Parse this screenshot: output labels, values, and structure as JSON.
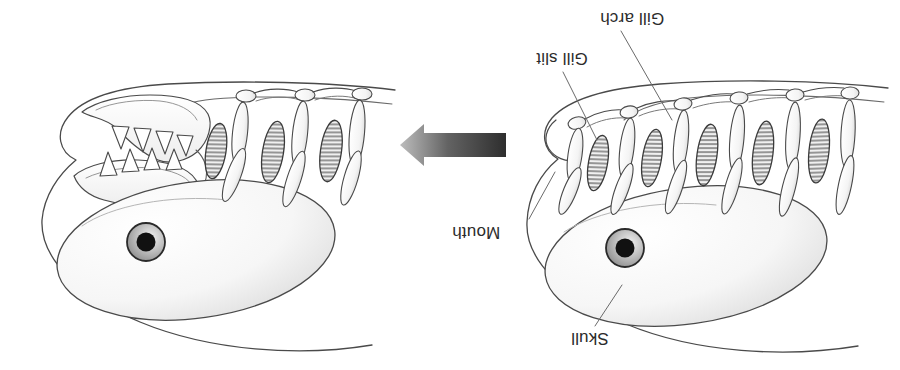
{
  "diagram": {
    "orientation": "rotated-180",
    "background_color": "#ffffff",
    "ink_color": "#3a3a3a",
    "label_color": "#2b2b2b"
  },
  "labels": {
    "gill_arch": "Gill arch",
    "gill_slit": "Gill slit",
    "mouth": "Mouth",
    "skull": "Skull"
  },
  "arrow": {
    "name": "transition-arrow",
    "direction": "left",
    "gradient_from": "#2e2e2e",
    "gradient_to": "#b9b9b9",
    "x": 400,
    "y": 132,
    "width": 106,
    "height": 27
  },
  "figures": [
    {
      "id": "jawed-fish",
      "name": "jawed-fish-head",
      "side": "left",
      "gill_arch_count": 3,
      "gill_slit_count": 3,
      "has_jaws": true,
      "tooth_count": 8,
      "eye": {
        "cx": 146,
        "cy": 242,
        "r_outer": 19,
        "r_pupil": 9
      }
    },
    {
      "id": "jawless-fish",
      "name": "jawless-fish-head",
      "side": "right",
      "gill_arch_count": 6,
      "gill_slit_count": 5,
      "has_jaws": false,
      "tooth_count": 0,
      "eye": {
        "cx": 625,
        "cy": 248,
        "r_outer": 19,
        "r_pupil": 9
      }
    }
  ],
  "leader_lines": [
    {
      "name": "leader-gill-arch",
      "from": [
        621,
        31
      ],
      "to": [
        672,
        120
      ]
    },
    {
      "name": "leader-gill-slit",
      "from": [
        563,
        72
      ],
      "to": [
        597,
        140
      ]
    },
    {
      "name": "leader-mouth",
      "from": [
        529,
        219
      ],
      "to": [
        555,
        172
      ]
    },
    {
      "name": "leader-skull",
      "from": [
        595,
        326
      ],
      "to": [
        622,
        285
      ]
    }
  ]
}
